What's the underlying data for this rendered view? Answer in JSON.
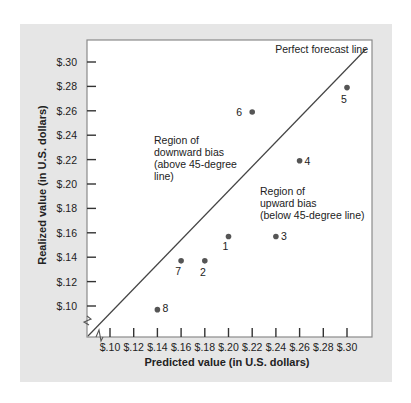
{
  "chart_data": {
    "type": "scatter",
    "title": "",
    "xlabel": "Predicted value (in U.S. dollars)",
    "ylabel": "Realized value (in U.S. dollars)",
    "x_ticks": [
      "$.10",
      "$.12",
      "$.14",
      "$.16",
      "$.18",
      "$.20",
      "$.22",
      "$.24",
      "$.26",
      "$.28",
      "$.30"
    ],
    "y_ticks": [
      "$.10",
      "$.12",
      "$.14",
      "$.16",
      "$.18",
      "$.20",
      "$.22",
      "$.24",
      "$.26",
      "$.28",
      "$.30"
    ],
    "xlim": [
      0.08,
      0.32
    ],
    "ylim": [
      0.08,
      0.32
    ],
    "grid": false,
    "axis_breaks": true,
    "reference_line": {
      "label": "Perfect forecast line",
      "slope": 1,
      "intercept": 0
    },
    "annotations": [
      {
        "id": "downward",
        "lines": [
          "Region of",
          "downward bias",
          "(above 45-degree",
          "line)"
        ]
      },
      {
        "id": "upward",
        "lines": [
          "Region of",
          "upward bias",
          "(below 45-degree line)"
        ]
      }
    ],
    "points": [
      {
        "label": "1",
        "x": 0.2,
        "y": 0.157
      },
      {
        "label": "2",
        "x": 0.18,
        "y": 0.137
      },
      {
        "label": "3",
        "x": 0.24,
        "y": 0.157
      },
      {
        "label": "4",
        "x": 0.26,
        "y": 0.219
      },
      {
        "label": "5",
        "x": 0.3,
        "y": 0.279
      },
      {
        "label": "6",
        "x": 0.22,
        "y": 0.259
      },
      {
        "label": "7",
        "x": 0.16,
        "y": 0.137
      },
      {
        "label": "8",
        "x": 0.14,
        "y": 0.097
      }
    ]
  },
  "colors": {
    "panel": "#e6e6e6",
    "plot": "#ffffff",
    "frame": "#8a8a8a",
    "point": "#555555",
    "line": "#444444"
  }
}
